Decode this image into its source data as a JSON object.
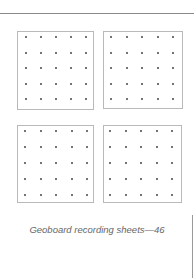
{
  "page": {
    "caption": "Geoboard recording sheets—46",
    "page_number": "46",
    "colors": {
      "rule": "#8a8a8a",
      "board_border": "#b9b9b9",
      "dot": "#444444",
      "caption": "#666666"
    }
  },
  "boards": [
    {
      "name": "board-top-left",
      "x": 17,
      "y": 31,
      "w": 77,
      "h": 79,
      "rows": 5,
      "cols": 5,
      "dot_x0": 26,
      "dot_y0": 37,
      "spacing_x": 15,
      "spacing_y": 15.5
    },
    {
      "name": "board-top-right",
      "x": 103,
      "y": 31,
      "w": 80,
      "h": 78,
      "rows": 5,
      "cols": 5,
      "dot_x0": 111,
      "dot_y0": 37,
      "spacing_x": 15.5,
      "spacing_y": 15.5
    },
    {
      "name": "board-bottom-left",
      "x": 17,
      "y": 125,
      "w": 77,
      "h": 78,
      "rows": 5,
      "cols": 5,
      "dot_x0": 25,
      "dot_y0": 131,
      "spacing_x": 15.5,
      "spacing_y": 16
    },
    {
      "name": "board-bottom-right",
      "x": 103,
      "y": 125,
      "w": 79,
      "h": 78,
      "rows": 5,
      "cols": 5,
      "dot_x0": 110,
      "dot_y0": 131,
      "spacing_x": 15.5,
      "spacing_y": 16
    }
  ]
}
